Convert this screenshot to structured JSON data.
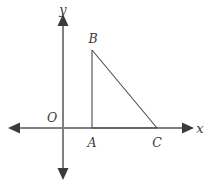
{
  "figure": {
    "background_color": "#ffffff",
    "axis_color": "#808080",
    "triangle_color": "#4a4a4a",
    "label_color": "#3b3b3b",
    "axes": {
      "x_label": "x",
      "y_label": "y",
      "origin_label": "O",
      "x_axis": {
        "x1": 12,
        "y1": 128,
        "x2": 190,
        "y2": 128
      },
      "y_axis": {
        "x1": 63,
        "y1": 18,
        "x2": 63,
        "y2": 176
      },
      "arrowheads": [
        "left",
        "right",
        "up",
        "down"
      ]
    },
    "labels": {
      "y": {
        "text": "y",
        "x": 63,
        "y": 14
      },
      "x": {
        "text": "x",
        "x": 199,
        "y": 132
      },
      "origin": {
        "text": "O",
        "x": 52,
        "y": 121
      },
      "A": {
        "text": "A",
        "x": 92,
        "y": 146
      },
      "B": {
        "text": "B",
        "x": 92,
        "y": 42
      },
      "C": {
        "text": "C",
        "x": 157,
        "y": 146
      }
    },
    "triangle": {
      "name": "triangle-ABC",
      "vertices": [
        {
          "name": "A",
          "x": 92,
          "y": 128
        },
        {
          "name": "B",
          "x": 92,
          "y": 50
        },
        {
          "name": "C",
          "x": 157,
          "y": 128
        }
      ],
      "right_angle_at": "A",
      "sides": [
        "AB",
        "BC",
        "CA"
      ]
    }
  }
}
